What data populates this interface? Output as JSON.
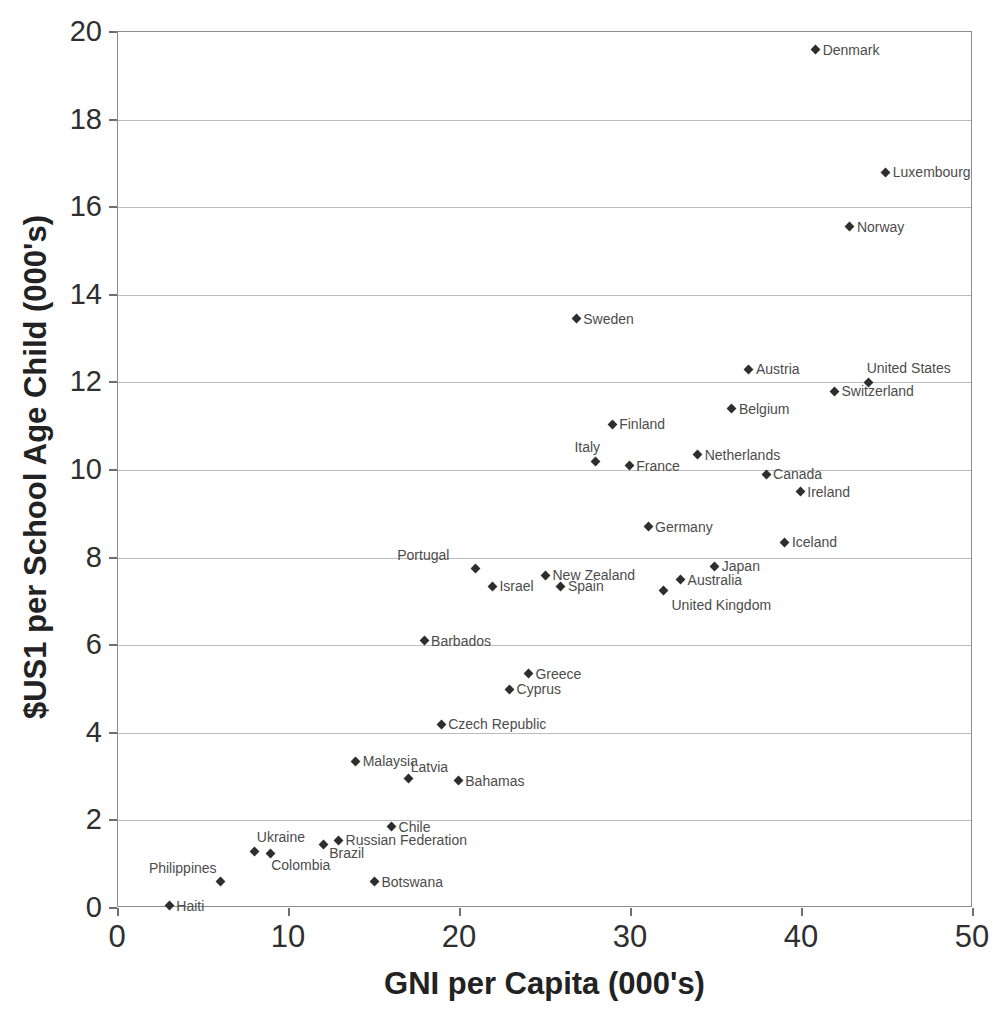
{
  "chart_data": {
    "type": "scatter",
    "title": "",
    "xlabel": "GNI per Capita (000's)",
    "ylabel": "$US1 per School Age Child (000's)",
    "xlim": [
      0,
      50
    ],
    "ylim": [
      0,
      20
    ],
    "x_ticks": [
      0,
      10,
      20,
      30,
      40,
      50
    ],
    "y_ticks": [
      0,
      2,
      4,
      6,
      8,
      10,
      12,
      14,
      16,
      18,
      20
    ],
    "grid": "horizontal",
    "legend": "none",
    "marker_shape": "diamond",
    "colors": {
      "marker": "#2e2e2e",
      "point_label": "#4c4c4c",
      "gridline": "#bcbcbc",
      "plot_border": "#8c8c8c",
      "axis_text": "#2f2f2f"
    },
    "points": [
      {
        "name": "Denmark",
        "x": 40.8,
        "y": 19.6,
        "label_pos": "right"
      },
      {
        "name": "Luxembourg",
        "x": 44.9,
        "y": 16.8,
        "label_pos": "right"
      },
      {
        "name": "Norway",
        "x": 42.8,
        "y": 15.55,
        "label_pos": "right"
      },
      {
        "name": "Sweden",
        "x": 26.8,
        "y": 13.45,
        "label_pos": "right"
      },
      {
        "name": "Austria",
        "x": 36.9,
        "y": 12.3,
        "label_pos": "right"
      },
      {
        "name": "United States",
        "x": 43.9,
        "y": 12.0,
        "label_pos": "above-right",
        "label_dx": -4,
        "label_dy": -2
      },
      {
        "name": "Switzerland",
        "x": 41.9,
        "y": 11.8,
        "label_pos": "right"
      },
      {
        "name": "Belgium",
        "x": 35.9,
        "y": 11.4,
        "label_pos": "right"
      },
      {
        "name": "Finland",
        "x": 28.9,
        "y": 11.05,
        "label_pos": "right"
      },
      {
        "name": "Netherlands",
        "x": 33.9,
        "y": 10.35,
        "label_pos": "right"
      },
      {
        "name": "Italy",
        "x": 27.9,
        "y": 10.2,
        "label_pos": "above-left",
        "label_dx": 9,
        "label_dy": -2
      },
      {
        "name": "France",
        "x": 29.9,
        "y": 10.1,
        "label_pos": "right"
      },
      {
        "name": "Canada",
        "x": 37.9,
        "y": 9.9,
        "label_pos": "right"
      },
      {
        "name": "Ireland",
        "x": 39.9,
        "y": 9.5,
        "label_pos": "right"
      },
      {
        "name": "Germany",
        "x": 31.0,
        "y": 8.7,
        "label_pos": "right"
      },
      {
        "name": "Iceland",
        "x": 39.0,
        "y": 8.35,
        "label_pos": "right"
      },
      {
        "name": "Japan",
        "x": 34.9,
        "y": 7.8,
        "label_pos": "right"
      },
      {
        "name": "Portugal",
        "x": 20.9,
        "y": 7.75,
        "label_pos": "above-left",
        "label_dx": -22,
        "label_dy": -2
      },
      {
        "name": "New Zealand",
        "x": 25.0,
        "y": 7.6,
        "label_pos": "right"
      },
      {
        "name": "Australia",
        "x": 32.9,
        "y": 7.5,
        "label_pos": "right"
      },
      {
        "name": "Israel",
        "x": 21.9,
        "y": 7.35,
        "label_pos": "right"
      },
      {
        "name": "Spain",
        "x": 25.9,
        "y": 7.35,
        "label_pos": "right"
      },
      {
        "name": "United Kingdom",
        "x": 31.9,
        "y": 7.25,
        "label_pos": "below-right",
        "label_dx": 6,
        "label_dy": 3
      },
      {
        "name": "Barbados",
        "x": 17.9,
        "y": 6.1,
        "label_pos": "right"
      },
      {
        "name": "Greece",
        "x": 24.0,
        "y": 5.35,
        "label_pos": "right"
      },
      {
        "name": "Cyprus",
        "x": 22.9,
        "y": 5.0,
        "label_pos": "right"
      },
      {
        "name": "Czech Republic",
        "x": 18.9,
        "y": 4.2,
        "label_pos": "right"
      },
      {
        "name": "Malaysia",
        "x": 13.9,
        "y": 3.35,
        "label_pos": "right"
      },
      {
        "name": "Latvia",
        "x": 17.0,
        "y": 2.95,
        "label_pos": "above-right"
      },
      {
        "name": "Bahamas",
        "x": 19.9,
        "y": 2.9,
        "label_pos": "right"
      },
      {
        "name": "Chile",
        "x": 16.0,
        "y": 1.85,
        "label_pos": "right"
      },
      {
        "name": "Russian Federation",
        "x": 12.9,
        "y": 1.55,
        "label_pos": "right"
      },
      {
        "name": "Brazil",
        "x": 12.0,
        "y": 1.45,
        "label_pos": "below-right",
        "label_dx": 4,
        "label_dy": -3
      },
      {
        "name": "Ukraine",
        "x": 8.0,
        "y": 1.3,
        "label_pos": "above-right",
        "label_dy": -2
      },
      {
        "name": "Colombia",
        "x": 8.9,
        "y": 1.25,
        "label_pos": "below-right",
        "label_dx": -1
      },
      {
        "name": "Philippines",
        "x": 6.0,
        "y": 0.6,
        "label_pos": "above-left",
        "label_dy": -2
      },
      {
        "name": "Botswana",
        "x": 15.0,
        "y": 0.6,
        "label_pos": "right"
      },
      {
        "name": "Haiti",
        "x": 3.0,
        "y": 0.05,
        "label_pos": "right"
      }
    ]
  }
}
